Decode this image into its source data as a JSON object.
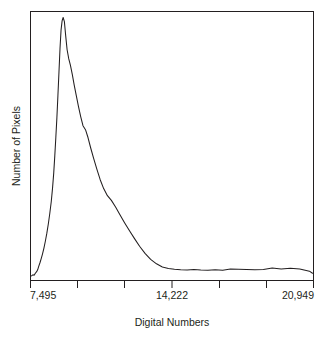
{
  "chart_data": {
    "type": "line",
    "title": "",
    "xlabel": "Digital Numbers",
    "ylabel": "Number of Pixels",
    "grid": false,
    "legend": "none",
    "xlim": [
      7495,
      20949
    ],
    "ylim": [
      0,
      1.0
    ],
    "x_tick_labels": [
      "7,495",
      "14,222",
      "20,949"
    ],
    "x_tick_values": [
      7495,
      14222,
      20949
    ],
    "x_minor_tick_count": 7,
    "y_tick_labels": [],
    "line_color": "#231f20",
    "series": [
      {
        "name": "Pixel count distribution",
        "x": [
          7495,
          7560,
          7620,
          7680,
          7740,
          7790,
          7840,
          7900,
          7960,
          8020,
          8090,
          8160,
          8230,
          8300,
          8370,
          8440,
          8500,
          8560,
          8610,
          8660,
          8710,
          8760,
          8810,
          8860,
          8910,
          8960,
          9010,
          9070,
          9130,
          9200,
          9280,
          9360,
          9450,
          9540,
          9640,
          9740,
          9850,
          9960,
          10080,
          10200,
          10330,
          10470,
          10620,
          10780,
          10950,
          11130,
          11320,
          11520,
          11730,
          11950,
          12180,
          12420,
          12670,
          12930,
          13200,
          13480,
          13760,
          14050,
          14340,
          14640,
          14950,
          15270,
          15600,
          15940,
          16290,
          16650,
          17020,
          17400,
          17790,
          18190,
          18600,
          19020,
          19450,
          19890,
          20340,
          20800,
          20949
        ],
        "values": [
          0.012,
          0.016,
          0.014,
          0.022,
          0.028,
          0.035,
          0.048,
          0.062,
          0.078,
          0.095,
          0.118,
          0.145,
          0.175,
          0.21,
          0.25,
          0.295,
          0.345,
          0.405,
          0.47,
          0.54,
          0.615,
          0.7,
          0.79,
          0.88,
          0.95,
          0.985,
          0.998,
          0.982,
          0.93,
          0.875,
          0.84,
          0.815,
          0.78,
          0.74,
          0.7,
          0.66,
          0.62,
          0.585,
          0.57,
          0.54,
          0.5,
          0.46,
          0.42,
          0.38,
          0.345,
          0.318,
          0.3,
          0.275,
          0.245,
          0.215,
          0.185,
          0.155,
          0.125,
          0.098,
          0.075,
          0.058,
          0.046,
          0.04,
          0.037,
          0.035,
          0.034,
          0.036,
          0.034,
          0.033,
          0.035,
          0.033,
          0.038,
          0.037,
          0.036,
          0.035,
          0.036,
          0.042,
          0.038,
          0.041,
          0.038,
          0.03,
          0.022
        ]
      }
    ]
  },
  "figure": {
    "background_color": "#ffffff",
    "axis_color": "#231f20"
  }
}
